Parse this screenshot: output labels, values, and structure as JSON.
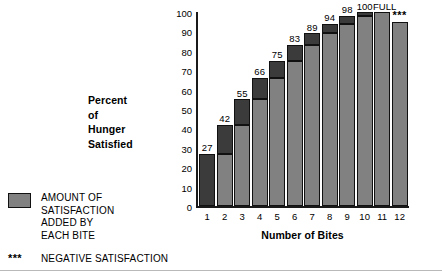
{
  "chart_data": {
    "type": "bar",
    "title": "",
    "xlabel": "Number of Bites",
    "ylabel": "Percent of Hunger Satisfied",
    "ylabel_lines": [
      "Percent",
      "of",
      "Hunger",
      "Satisfied"
    ],
    "categories": [
      "1",
      "2",
      "3",
      "4",
      "5",
      "6",
      "7",
      "8",
      "9",
      "10",
      "11",
      "12"
    ],
    "values": [
      27,
      42,
      55,
      66,
      75,
      83,
      89,
      94,
      98,
      100,
      100,
      95
    ],
    "increments": [
      27,
      15,
      13,
      11,
      9,
      8,
      6,
      5,
      4,
      2,
      0,
      -5
    ],
    "point_labels": [
      "27",
      "42",
      "55",
      "66",
      "75",
      "83",
      "89",
      "94",
      "98",
      "100",
      "FULL",
      "***"
    ],
    "ylim": [
      0,
      100
    ],
    "yticks": [
      0,
      10,
      20,
      30,
      40,
      50,
      60,
      70,
      80,
      90,
      100
    ],
    "ytick_labels": [
      "0",
      "10",
      "20",
      "30",
      "40",
      "50",
      "60",
      "70",
      "80",
      "90",
      "100"
    ],
    "grid": false,
    "legend_position": "bottom-left",
    "series": [
      {
        "name": "Amount of satisfaction added by each bite",
        "color": "#3b3b3b"
      },
      {
        "name": "Cumulative satisfaction",
        "color": "#818181"
      }
    ],
    "annotations": [
      {
        "text": "FULL",
        "bar": 11,
        "meaning": "hunger fully satisfied at 100 percent"
      },
      {
        "text": "***",
        "bar": 12,
        "meaning": "negative satisfaction"
      }
    ]
  },
  "legend": {
    "swatch_color": "#818181",
    "amount_lines": [
      "AMOUNT OF",
      "SATISFACTION",
      "ADDED BY",
      "EACH BITE"
    ],
    "negative_marker": "***",
    "negative_label": "NEGATIVE SATISFACTION"
  },
  "icons": {
    "ice_cream": "ice-cream-cone-icon"
  }
}
